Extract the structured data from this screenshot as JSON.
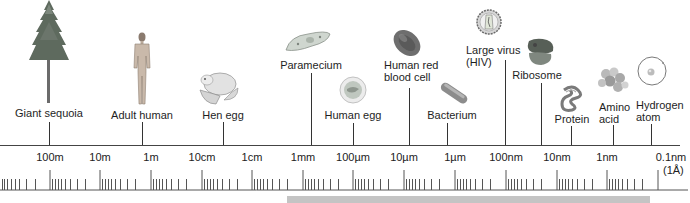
{
  "objects": [
    {
      "id": "giant-sequoia",
      "label": "Giant sequoia",
      "x": 49,
      "label_top": 107,
      "line_top": 122,
      "align": "center"
    },
    {
      "id": "adult-human",
      "label": "Adult human",
      "x": 142,
      "label_top": 109,
      "line_top": 122,
      "align": "center"
    },
    {
      "id": "hen-egg",
      "label": "Hen egg",
      "x": 223,
      "label_top": 109,
      "line_top": 122,
      "align": "center"
    },
    {
      "id": "paramecium",
      "label": "Paramecium",
      "x": 311,
      "label_top": 59,
      "line_top": 73,
      "align": "center"
    },
    {
      "id": "human-egg",
      "label": "Human egg",
      "x": 353,
      "label_top": 109,
      "line_top": 123,
      "align": "center"
    },
    {
      "id": "human-red-blood-cell",
      "label_lines": [
        "Human red",
        "blood cell"
      ],
      "x": 409,
      "label_left": 384,
      "label_top": 59,
      "line_top": 88,
      "align": "left"
    },
    {
      "id": "bacterium",
      "label": "Bacterium",
      "x": 447,
      "label_top": 109,
      "line_top": 123,
      "align": "center"
    },
    {
      "id": "large-virus",
      "label_lines": [
        "Large virus",
        "(HIV)"
      ],
      "x": 505,
      "label_left": 466,
      "label_top": 44,
      "line_top": 60,
      "align": "left"
    },
    {
      "id": "ribosome",
      "label": "Ribosome",
      "x": 541,
      "label_top": 69,
      "line_top": 83,
      "align": "center"
    },
    {
      "id": "protein",
      "label": "Protein",
      "x": 571,
      "label_top": 113,
      "line_top": 126,
      "align": "center"
    },
    {
      "id": "amino-acid",
      "label_lines": [
        "Amino",
        "acid"
      ],
      "x": 613,
      "label_left": 599,
      "label_top": 101,
      "line_top": 125,
      "align": "left"
    },
    {
      "id": "hydrogen-atom",
      "label_lines": [
        "Hydrogen",
        "atom"
      ],
      "x": 651,
      "label_left": 636,
      "label_top": 99,
      "line_top": 124,
      "align": "left"
    }
  ],
  "labels": {
    "giant_sequoia": "Giant sequoia",
    "adult_human": "Adult human",
    "hen_egg": "Hen egg",
    "paramecium": "Paramecium",
    "human_egg": "Human egg",
    "rbc_line1": "Human red",
    "rbc_line2": "blood cell",
    "bacterium": "Bacterium",
    "virus_line1": "Large virus",
    "virus_line2": "(HIV)",
    "ribosome": "Ribosome",
    "protein": "Protein",
    "amino_line1": "Amino",
    "amino_line2": "acid",
    "hydrogen_line1": "Hydrogen",
    "hydrogen_line2": "atom"
  },
  "scale": {
    "ticks": [
      {
        "label": "100m",
        "x": 50
      },
      {
        "label": "10m",
        "x": 100
      },
      {
        "label": "1m",
        "x": 151
      },
      {
        "label": "10cm",
        "x": 202
      },
      {
        "label": "1cm",
        "x": 252
      },
      {
        "label": "1mm",
        "x": 303
      },
      {
        "label": "100µm",
        "x": 353
      },
      {
        "label": "10µm",
        "x": 404
      },
      {
        "label": "1µm",
        "x": 455
      },
      {
        "label": "100nm",
        "x": 506
      },
      {
        "label": "10nm",
        "x": 557
      },
      {
        "label": "1nm",
        "x": 607
      },
      {
        "label": "0.1nm",
        "x": 658
      }
    ],
    "angstrom_note": "(1Å)",
    "decade_width": 50.7
  },
  "gray_bar": {
    "left": 287,
    "width": 363,
    "top": 196,
    "height": 7,
    "color": "#c4c4c4"
  },
  "colors": {
    "line": "#333333",
    "text": "#1e1e1e",
    "bar": "#c4c4c4"
  }
}
